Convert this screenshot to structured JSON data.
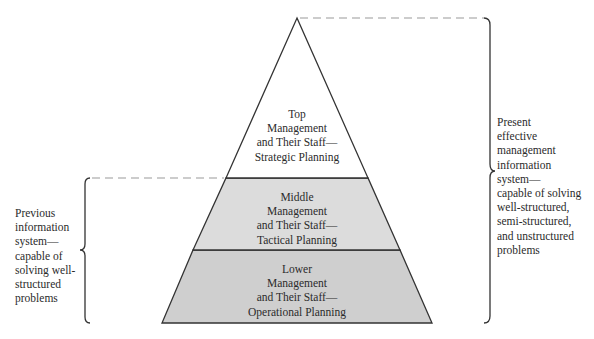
{
  "colors": {
    "background": "#ffffff",
    "top_fill": "#ffffff",
    "middle_fill": "#dcdcdc",
    "lower_fill": "#cfcfcf",
    "stroke": "#333333",
    "dash": "#999999"
  },
  "pyramid": {
    "layers": [
      {
        "id": "top",
        "lines": [
          "Top",
          "Management",
          "and Their Staff—",
          "Strategic Planning"
        ]
      },
      {
        "id": "middle",
        "lines": [
          "Middle",
          "Management",
          "and Their Staff—",
          "Tactical Planning"
        ]
      },
      {
        "id": "lower",
        "lines": [
          "Lower",
          "Management",
          "and Their Staff—",
          "Operational Planning"
        ]
      }
    ]
  },
  "left_annotation": {
    "lines": [
      "Previous",
      "information",
      "system—",
      "capable of",
      "solving well-",
      "structured",
      "problems"
    ]
  },
  "right_annotation": {
    "lines": [
      "Present",
      "effective",
      "management",
      "information",
      "system—",
      "capable of solving",
      "well-structured,",
      "semi-structured,",
      "and unstructured",
      "problems"
    ]
  }
}
